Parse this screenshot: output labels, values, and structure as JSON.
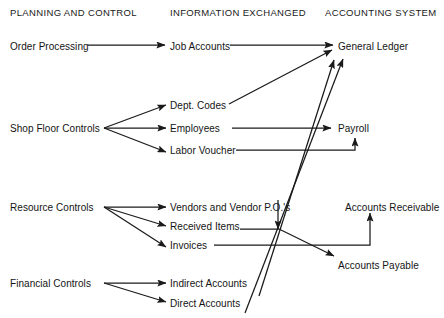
{
  "diagram": {
    "type": "flow-diagram",
    "canvas": {
      "width": 444,
      "height": 318
    },
    "stroke_color": "#1a1a1a",
    "text_color": "#141414",
    "background_color": "#ffffff",
    "columns": [
      {
        "id": "planning",
        "label": "PLANNING AND CONTROL",
        "x": 10,
        "y": 8
      },
      {
        "id": "information",
        "label": "INFORMATION EXCHANGED",
        "x": 170,
        "y": 8
      },
      {
        "id": "accounting",
        "label": "ACCOUNTING SYSTEM",
        "x": 325,
        "y": 8
      }
    ],
    "nodes": [
      {
        "id": "order-processing",
        "label": "Order Processing",
        "column": "planning",
        "x": 10,
        "y": 42
      },
      {
        "id": "shop-floor-controls",
        "label": "Shop Floor Controls",
        "column": "planning",
        "x": 10,
        "y": 124
      },
      {
        "id": "resource-controls",
        "label": "Resource Controls",
        "column": "planning",
        "x": 10,
        "y": 203
      },
      {
        "id": "financial-controls",
        "label": "Financial Controls",
        "column": "planning",
        "x": 10,
        "y": 279
      },
      {
        "id": "job-accounts",
        "label": "Job Accounts",
        "column": "information",
        "x": 170,
        "y": 42
      },
      {
        "id": "dept-codes",
        "label": "Dept. Codes",
        "column": "information",
        "x": 170,
        "y": 101
      },
      {
        "id": "employees",
        "label": "Employees",
        "column": "information",
        "x": 170,
        "y": 124
      },
      {
        "id": "labor-voucher",
        "label": "Labor Voucher",
        "column": "information",
        "x": 170,
        "y": 146
      },
      {
        "id": "vendors-and-vendor-pos",
        "label": "Vendors and Vendor P.O.'s",
        "column": "information",
        "x": 170,
        "y": 203
      },
      {
        "id": "received-items",
        "label": "Received Items",
        "column": "information",
        "x": 170,
        "y": 222
      },
      {
        "id": "invoices",
        "label": "Invoices",
        "column": "information",
        "x": 170,
        "y": 241
      },
      {
        "id": "indirect-accounts",
        "label": "Indirect Accounts",
        "column": "information",
        "x": 170,
        "y": 279
      },
      {
        "id": "direct-accounts",
        "label": "Direct Accounts",
        "column": "information",
        "x": 170,
        "y": 299
      },
      {
        "id": "general-ledger",
        "label": "General Ledger",
        "column": "accounting",
        "x": 338,
        "y": 42
      },
      {
        "id": "payroll",
        "label": "Payroll",
        "column": "accounting",
        "x": 338,
        "y": 124
      },
      {
        "id": "accounts-receivable",
        "label": "Accounts Receivable",
        "column": "accounting",
        "x": 345,
        "y": 203
      },
      {
        "id": "accounts-payable",
        "label": "Accounts Payable",
        "column": "accounting",
        "x": 338,
        "y": 261
      }
    ],
    "edges": [
      {
        "id": "order-processing-to-job-accounts",
        "from": "order-processing",
        "to": "job-accounts",
        "style": "straight"
      },
      {
        "id": "job-accounts-to-general-ledger",
        "from": "job-accounts",
        "to": "general-ledger",
        "style": "straight"
      },
      {
        "id": "shop-floor-controls-to-dept-codes",
        "from": "shop-floor-controls",
        "to": "dept-codes",
        "style": "fan"
      },
      {
        "id": "shop-floor-controls-to-employees",
        "from": "shop-floor-controls",
        "to": "employees",
        "style": "fan"
      },
      {
        "id": "shop-floor-controls-to-labor-voucher",
        "from": "shop-floor-controls",
        "to": "labor-voucher",
        "style": "fan"
      },
      {
        "id": "dept-codes-to-general-ledger",
        "from": "dept-codes",
        "to": "general-ledger",
        "style": "diagonal"
      },
      {
        "id": "employees-to-payroll",
        "from": "employees",
        "to": "payroll",
        "style": "straight"
      },
      {
        "id": "labor-voucher-to-payroll",
        "from": "labor-voucher",
        "to": "payroll",
        "style": "elbow"
      },
      {
        "id": "resource-controls-to-vendors",
        "from": "resource-controls",
        "to": "vendors-and-vendor-pos",
        "style": "fan"
      },
      {
        "id": "resource-controls-to-received-items",
        "from": "resource-controls",
        "to": "received-items",
        "style": "fan"
      },
      {
        "id": "resource-controls-to-invoices",
        "from": "resource-controls",
        "to": "invoices",
        "style": "fan"
      },
      {
        "id": "vendors-to-junction",
        "from": "vendors-and-vendor-pos",
        "to": "received-items",
        "style": "vertical"
      },
      {
        "id": "received-items-to-accounts-payable",
        "from": "received-items",
        "to": "accounts-payable",
        "style": "diagonal"
      },
      {
        "id": "invoices-to-accounts-receivable",
        "from": "invoices",
        "to": "accounts-receivable",
        "style": "elbow"
      },
      {
        "id": "financial-controls-to-indirect-accounts",
        "from": "financial-controls",
        "to": "indirect-accounts",
        "style": "fan"
      },
      {
        "id": "financial-controls-to-direct-accounts",
        "from": "financial-controls",
        "to": "direct-accounts",
        "style": "fan"
      },
      {
        "id": "indirect-accounts-to-general-ledger",
        "from": "indirect-accounts",
        "to": "general-ledger",
        "style": "long-diagonal"
      },
      {
        "id": "direct-accounts-to-general-ledger",
        "from": "direct-accounts",
        "to": "general-ledger",
        "style": "long-diagonal"
      }
    ]
  }
}
